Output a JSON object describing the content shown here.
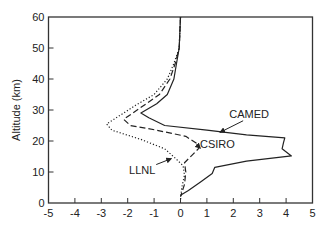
{
  "chart_data": {
    "type": "line",
    "title": "",
    "xlabel": "",
    "ylabel": "Altitude (km)",
    "xlim": [
      -5,
      5
    ],
    "ylim": [
      0,
      60
    ],
    "xticks": [
      -5,
      -4,
      -3,
      -2,
      -1,
      0,
      1,
      2,
      3,
      4,
      5
    ],
    "yticks": [
      0,
      10,
      20,
      30,
      40,
      50,
      60
    ],
    "grid": false,
    "legend": "none (inline annotations with arrows)",
    "series": [
      {
        "name": "CAMED",
        "style": "solid",
        "points": [
          [
            0,
            60
          ],
          [
            -0.05,
            50
          ],
          [
            -0.15,
            45
          ],
          [
            -0.25,
            40
          ],
          [
            -0.5,
            35
          ],
          [
            -0.9,
            32
          ],
          [
            -1.5,
            29
          ],
          [
            -1.2,
            27.5
          ],
          [
            -0.6,
            25
          ],
          [
            1.0,
            23.5
          ],
          [
            2.5,
            22
          ],
          [
            3.95,
            21
          ],
          [
            3.9,
            19.5
          ],
          [
            3.85,
            17.5
          ],
          [
            4.2,
            15.2
          ],
          [
            2.5,
            13.5
          ],
          [
            1.3,
            11.5
          ],
          [
            1.2,
            9.5
          ],
          [
            0.8,
            7
          ],
          [
            0.3,
            4
          ],
          [
            0,
            2.5
          ]
        ]
      },
      {
        "name": "CSIRO",
        "style": "dashed",
        "points": [
          [
            0,
            60
          ],
          [
            -0.05,
            50
          ],
          [
            -0.2,
            45
          ],
          [
            -0.4,
            40
          ],
          [
            -0.8,
            35
          ],
          [
            -1.3,
            32
          ],
          [
            -2.15,
            27
          ],
          [
            -1.9,
            25
          ],
          [
            -0.9,
            23.5
          ],
          [
            0.2,
            21.5
          ],
          [
            0.65,
            19
          ],
          [
            0.7,
            17.7
          ],
          [
            0.45,
            15.5
          ],
          [
            0.15,
            13
          ],
          [
            0.2,
            10
          ],
          [
            0.15,
            6
          ],
          [
            0.0,
            2
          ]
        ]
      },
      {
        "name": "LLNL",
        "style": "dotted",
        "points": [
          [
            0,
            60
          ],
          [
            -0.05,
            50
          ],
          [
            -0.25,
            45
          ],
          [
            -0.5,
            40
          ],
          [
            -1.0,
            35
          ],
          [
            -1.7,
            31.5
          ],
          [
            -2.8,
            25.5
          ],
          [
            -2.6,
            23.5
          ],
          [
            -1.5,
            20.5
          ],
          [
            -0.6,
            17.5
          ],
          [
            -0.2,
            14.5
          ],
          [
            0.1,
            12
          ],
          [
            0.15,
            9
          ],
          [
            0.05,
            5
          ],
          [
            0,
            1
          ]
        ]
      }
    ],
    "annotations": [
      {
        "text": "CAMED",
        "label_at": [
          2.6,
          27.5
        ],
        "arrow_to": [
          1.5,
          22.8
        ]
      },
      {
        "text": "CSIRO",
        "label_at": [
          1.4,
          17.6
        ],
        "arrow_to": [
          0.75,
          17.7
        ]
      },
      {
        "text": "LLNL",
        "label_at": [
          -1.45,
          9.5
        ],
        "arrow_to": [
          -0.35,
          14.3
        ]
      }
    ]
  },
  "labels": {
    "ylabel": "Altitude (km)"
  }
}
